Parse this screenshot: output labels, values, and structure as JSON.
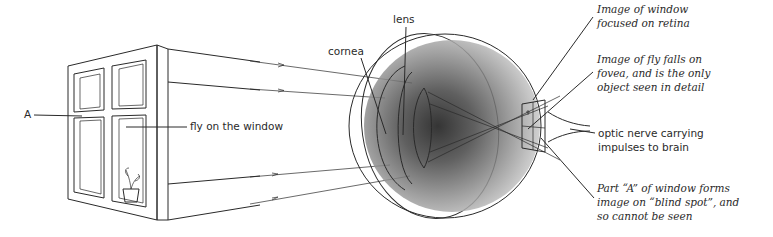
{
  "diagram": {
    "labels": {
      "A": "A",
      "fly": "fly on the window",
      "cornea": "cornea",
      "lens": "lens",
      "window_image": [
        "Image of window",
        "focused on retina"
      ],
      "fly_image": [
        "Image of fly falls on",
        "fovea, and is the only",
        "object seen in detail"
      ],
      "optic_nerve": [
        "optic nerve carrying",
        "impulses to brain"
      ],
      "blind_spot": [
        "Part “A” of window forms",
        "image on “blind spot”, and",
        "so cannot be seen"
      ]
    },
    "components": [
      "window",
      "plant-pot",
      "light-rays",
      "cornea",
      "lens",
      "vitreous-humour",
      "retina",
      "fovea",
      "blind-spot",
      "optic-nerve"
    ]
  }
}
